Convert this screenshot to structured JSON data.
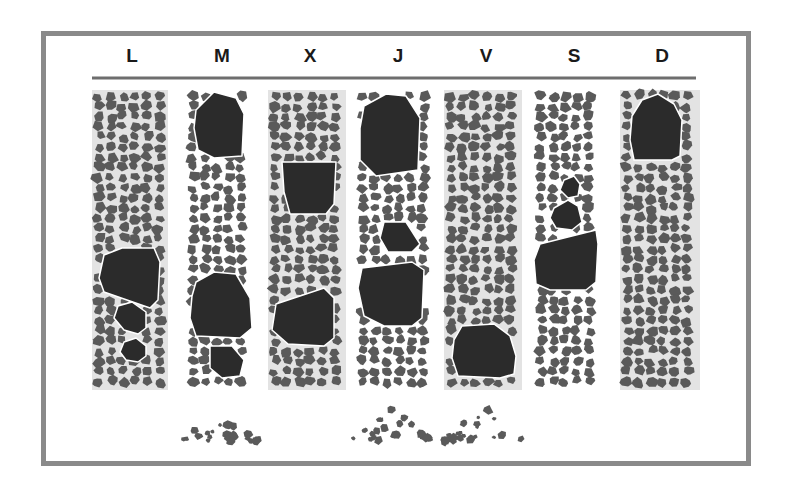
{
  "figure": {
    "columns": [
      {
        "label": "L",
        "shaded": true,
        "boulders": 3,
        "debris_pile": false
      },
      {
        "label": "M",
        "shaded": false,
        "boulders": 3,
        "debris_pile": true
      },
      {
        "label": "X",
        "shaded": true,
        "boulders": 2,
        "debris_pile": false
      },
      {
        "label": "J",
        "shaded": false,
        "boulders": 3,
        "debris_pile": true
      },
      {
        "label": "V",
        "shaded": true,
        "boulders": 1,
        "debris_pile": true
      },
      {
        "label": "S",
        "shaded": false,
        "boulders": 3,
        "debris_pile": false
      },
      {
        "label": "D",
        "shaded": true,
        "boulders": 1,
        "debris_pile": false
      }
    ]
  },
  "colors": {
    "frame": "#8a8a8a",
    "column_shade": "#e3e3e3",
    "gravel": "#5a5a5a",
    "boulder": "#2b2b2b",
    "rule": "#6e6e6e",
    "label": "#1a1a1a"
  }
}
